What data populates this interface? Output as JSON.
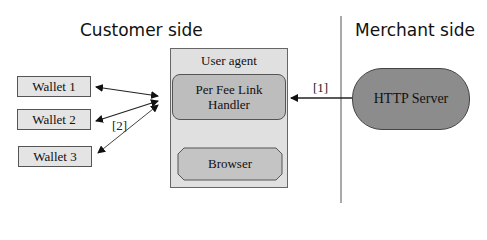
{
  "diagram": {
    "sections": {
      "customer": "Customer side",
      "merchant": "Merchant side"
    },
    "wallets": [
      {
        "label": "Wallet  1"
      },
      {
        "label": "Wallet  2"
      },
      {
        "label": "Wallet  3"
      }
    ],
    "user_agent": {
      "label": "User agent",
      "handler": "Per Fee Link Handler",
      "browser": "Browser"
    },
    "server": {
      "label": "HTTP Server"
    },
    "edge_labels": {
      "server_to_handler": "[1]",
      "handler_to_wallets": "[2]"
    },
    "colors": {
      "wallet_fill": "#e4e4e4",
      "user_agent_fill": "#e0e0e0",
      "handler_fill": "#bdbdbd",
      "server_fill": "#8c8c8c"
    }
  }
}
